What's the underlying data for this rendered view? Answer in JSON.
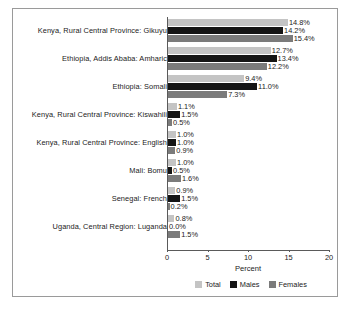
{
  "chart_data": {
    "type": "bar",
    "orientation": "horizontal",
    "title": "",
    "xlabel": "Percent",
    "ylabel": "",
    "xlim": [
      0,
      20
    ],
    "xticks": [
      0,
      5,
      10,
      15,
      20
    ],
    "xtick_labels": [
      "0",
      "5",
      "10",
      "15",
      "20"
    ],
    "grid": false,
    "legend_position": "bottom",
    "value_label_suffix": "%",
    "categories": [
      "Kenya, Rural Central Province: Gikuyu",
      "Ethiopia, Addis Ababa: Amharic",
      "Ethiopia: Somali",
      "Kenya, Rural Central Province: Kiswahili",
      "Kenya, Rural Central Province: English",
      "Mali: Bomu",
      "Senegal: French",
      "Uganda, Central Region: Luganda"
    ],
    "series": [
      {
        "name": "Total",
        "color": "#c4c4c4",
        "values": [
          14.8,
          12.7,
          9.4,
          1.1,
          1.0,
          1.0,
          0.9,
          0.8
        ],
        "labels": [
          "14.8%",
          "12.7%",
          "9.4%",
          "1.1%",
          "1.0%",
          "1.0%",
          "0.9%",
          "0.8%"
        ]
      },
      {
        "name": "Males",
        "color": "#151515",
        "values": [
          14.2,
          13.4,
          11.0,
          1.5,
          1.0,
          0.5,
          1.5,
          0.0
        ],
        "labels": [
          "14.2%",
          "13.4%",
          "11.0%",
          "1.5%",
          "1.0%",
          "0.5%",
          "1.5%",
          "0.0%"
        ]
      },
      {
        "name": "Females",
        "color": "#7b7b7b",
        "values": [
          15.4,
          12.2,
          7.3,
          0.5,
          0.9,
          1.6,
          0.2,
          1.5
        ],
        "labels": [
          "15.4%",
          "12.2%",
          "7.3%",
          "0.5%",
          "0.9%",
          "1.6%",
          "0.2%",
          "1.5%"
        ]
      }
    ]
  },
  "legend": {
    "items": [
      {
        "label": "Total"
      },
      {
        "label": "Males"
      },
      {
        "label": "Females"
      }
    ]
  },
  "axis": {
    "x_title": "Percent"
  }
}
